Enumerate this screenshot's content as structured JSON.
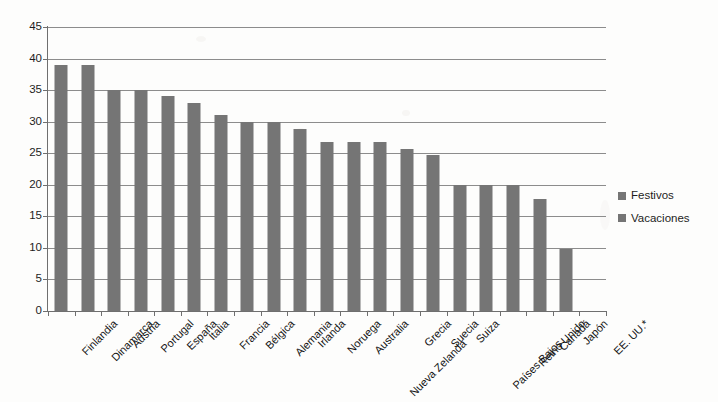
{
  "chart_data": {
    "type": "bar",
    "title": "",
    "subtitle": "",
    "xlabel": "",
    "ylabel": "",
    "ylim": [
      0,
      45
    ],
    "ytick_step": 5,
    "yticks": [
      0,
      5,
      10,
      15,
      20,
      25,
      30,
      35,
      40,
      45
    ],
    "ytick_labels": [
      "0",
      "5",
      "10",
      "15",
      "20",
      "25",
      "30",
      "35",
      "40",
      "45"
    ],
    "grid": true,
    "legend_position": "right",
    "categories": [
      "Finlandia",
      "Dinamarca",
      "Austria",
      "Portugal",
      "España",
      "Italia",
      "Francia",
      "Bélgica",
      "Alemania",
      "Irlanda",
      "Noruega",
      "Australia",
      "Nueva Zelanda",
      "Grecia",
      "Suecia",
      "Suiza",
      "Países Bajos",
      "Reino Unido",
      "Canadá",
      "Japón",
      "EE. UU.*"
    ],
    "series": [
      {
        "name": "Vacaciones",
        "color": "#757575",
        "values": [
          39,
          39,
          35,
          35,
          34,
          33,
          31,
          30,
          30,
          28.8,
          26.8,
          26.8,
          26.8,
          25.6,
          24.7,
          20,
          20,
          20,
          17.7,
          9.8,
          0
        ]
      }
    ],
    "legend": [
      {
        "label": "Festivos",
        "color": "#757575"
      },
      {
        "label": "Vacaciones",
        "color": "#757575"
      }
    ],
    "annotations": []
  },
  "colors": {
    "bar": "#757575",
    "gridline": "#8c8c8c",
    "axis": "#6f6f6f",
    "text": "#1d1d1d",
    "background": "#fdfdfc"
  }
}
